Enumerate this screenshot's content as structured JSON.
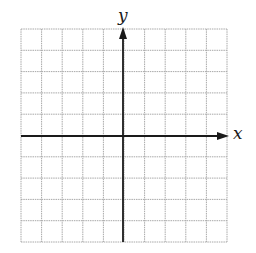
{
  "diagram": {
    "type": "coordinate-grid",
    "grid": {
      "columns": 10,
      "rows": 10,
      "left": 21,
      "top": 29,
      "right": 227,
      "bottom": 242,
      "line_color": "#a8a8a8",
      "line_style": "dotted"
    },
    "axes": {
      "color": "#1a1a1a",
      "origin": {
        "x": 123,
        "y": 136
      },
      "x_axis": {
        "label": "x",
        "arrow": "right"
      },
      "y_axis": {
        "label": "y",
        "arrow": "up"
      }
    }
  },
  "chart_data": {
    "type": "scatter",
    "title": "",
    "xlabel": "x",
    "ylabel": "y",
    "xlim": [
      -5,
      5
    ],
    "ylim": [
      -5,
      5
    ],
    "grid": true,
    "series": []
  }
}
